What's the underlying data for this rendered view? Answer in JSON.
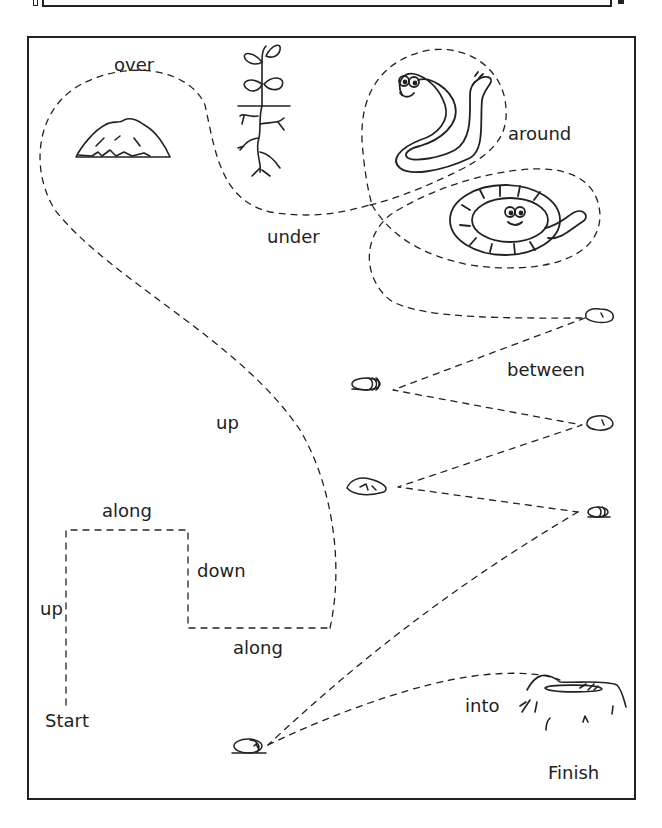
{
  "worksheet": {
    "title": "Positional language path",
    "words": {
      "over": "over",
      "under": "under",
      "around": "around",
      "between": "between",
      "up_long": "up",
      "along_top": "along",
      "down": "down",
      "up_short": "up",
      "along_bottom": "along",
      "into": "into",
      "start": "Start",
      "finish": "Finish"
    },
    "pictures": [
      {
        "name": "soil-mound",
        "label": "mound of earth"
      },
      {
        "name": "plant-with-roots",
        "label": "plant with roots"
      },
      {
        "name": "worm-s-shape",
        "label": "worm"
      },
      {
        "name": "worm-coiled",
        "label": "coiled worm"
      },
      {
        "name": "stones",
        "label": "stones"
      },
      {
        "name": "hole-in-ground",
        "label": "hole"
      }
    ],
    "colors": {
      "ink": "#222222",
      "paper": "#ffffff"
    }
  }
}
